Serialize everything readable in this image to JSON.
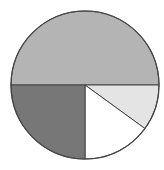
{
  "chart_data": {
    "type": "pie",
    "title": "",
    "categories": [
      "Slice A (top half)",
      "Slice B (bottom-left)",
      "Slice C (bottom-right, white)",
      "Slice D (right, light gray)"
    ],
    "values": [
      50,
      25,
      15,
      10
    ],
    "unit": "percent (estimated)",
    "start_angle_deg": 0,
    "direction": "clockwise from 3 o'clock, screen coords",
    "colors": [
      "#b4b4b4",
      "#777777",
      "#ffffff",
      "#e4e4e4"
    ],
    "legend": "none",
    "labels": "none"
  },
  "style": {
    "outline_color": "#444444",
    "center": [
      85,
      85
    ],
    "radius": 74
  }
}
